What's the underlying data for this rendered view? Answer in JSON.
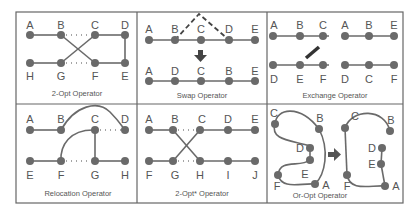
{
  "figure": {
    "panels": [
      {
        "id": "two-opt",
        "caption": "2-Opt Operator",
        "top_labels": [
          "A",
          "B",
          "C",
          "D"
        ],
        "bottom_labels": [
          "H",
          "G",
          "F",
          "E"
        ]
      },
      {
        "id": "swap",
        "caption": "Swap Operator",
        "top_labels": [
          "A",
          "B",
          "C",
          "D",
          "E"
        ],
        "bottom_labels": [
          "A",
          "D",
          "C",
          "B",
          "E"
        ]
      },
      {
        "id": "exchange",
        "caption": "Exchange Operator",
        "left_top": [
          "A",
          "B",
          "C"
        ],
        "left_bottom": [
          "D",
          "E",
          "F"
        ],
        "right_top": [
          "A",
          "B",
          "E"
        ],
        "right_bottom": [
          "D",
          "C",
          "F"
        ]
      },
      {
        "id": "relocation",
        "caption": "Relocation Operator",
        "top_labels": [
          "A",
          "B",
          "C",
          "D"
        ],
        "bottom_labels": [
          "E",
          "F",
          "G",
          "H"
        ]
      },
      {
        "id": "two-opt-star",
        "caption": "2-Opt* Operator",
        "top_labels": [
          "A",
          "B",
          "C",
          "D",
          "E"
        ],
        "bottom_labels": [
          "F",
          "G",
          "H",
          "I",
          "J"
        ]
      },
      {
        "id": "or-opt",
        "caption": "Or-Opt Operator",
        "left_labels": [
          "C",
          "B",
          "D",
          "E",
          "F",
          "A"
        ],
        "right_labels": [
          "C",
          "B",
          "D",
          "E",
          "F",
          "A"
        ]
      }
    ]
  }
}
